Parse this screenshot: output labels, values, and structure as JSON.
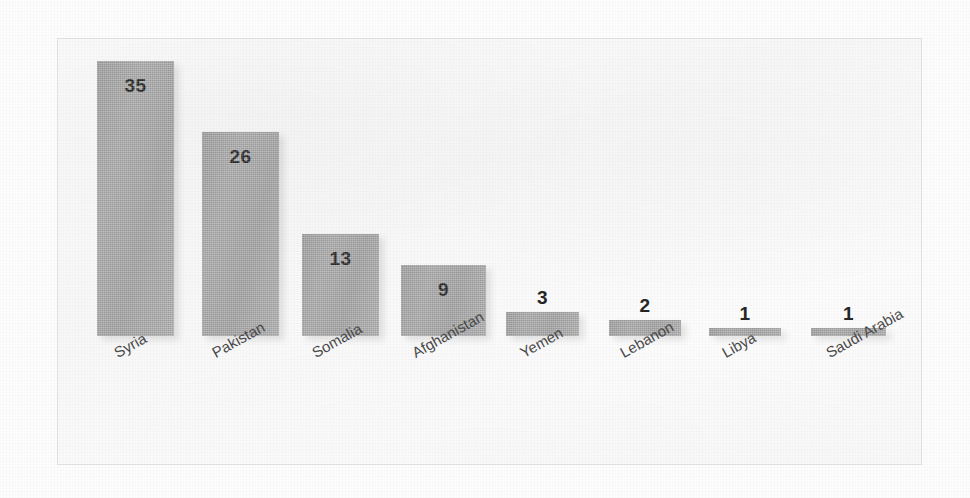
{
  "chart_data": {
    "type": "bar",
    "title": "",
    "subtitle": "",
    "xlabel": "",
    "ylabel": "",
    "categories": [
      "Syria",
      "Pakistan",
      "Somalia",
      "Afghanistan",
      "Yemen",
      "Lebanon",
      "Libya",
      "Saudi Arabia"
    ],
    "values": [
      35,
      26,
      13,
      9,
      3,
      2,
      1,
      1
    ],
    "value_labels": [
      "35",
      "26",
      "13",
      "9",
      "3",
      "2",
      "1",
      "1"
    ],
    "ylim": [
      0,
      35
    ],
    "grid": false,
    "legend": null,
    "axis_line": false,
    "tick_labels_y": [],
    "orientation": "vertical",
    "label_rotation_deg": -29,
    "colors": {
      "bar_fill": "#a8a8a8",
      "bar_fill_light": "#b2b2b2",
      "bar_fill_dark": "#a2a2a2",
      "value_text": "#262626",
      "category_text": "#4a4a4a",
      "plot_background": "#f9f9f9",
      "frame_border": "#e3e3e3",
      "page_background": "#fdfdfd"
    }
  }
}
